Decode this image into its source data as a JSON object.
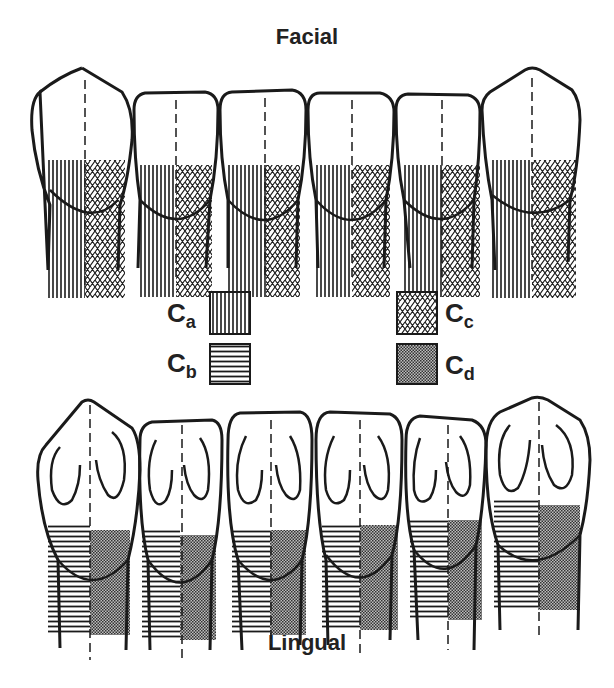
{
  "titles": {
    "top": "Facial",
    "bottom": "Lingual"
  },
  "legend": {
    "items": [
      {
        "key": "a",
        "base": "C",
        "sub": "a",
        "pattern": "vertical-lines"
      },
      {
        "key": "b",
        "base": "C",
        "sub": "b",
        "pattern": "horizontal-lines"
      },
      {
        "key": "c",
        "base": "C",
        "sub": "c",
        "pattern": "crosshatch"
      },
      {
        "key": "d",
        "base": "C",
        "sub": "d",
        "pattern": "stipple"
      }
    ]
  },
  "rows": {
    "facial": {
      "tooth_count": 6,
      "left_pattern": "vertical-lines",
      "right_pattern": "crosshatch"
    },
    "lingual": {
      "tooth_count": 6,
      "left_pattern": "horizontal-lines",
      "right_pattern": "stipple"
    }
  },
  "colors": {
    "ink": "#1a1a1a",
    "background": "#ffffff"
  }
}
